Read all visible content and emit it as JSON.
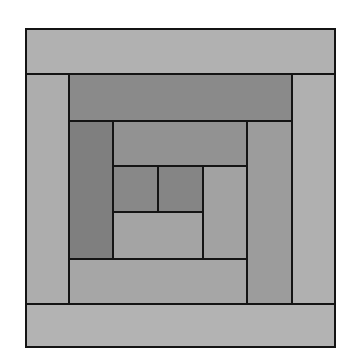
{
  "diagram": {
    "title": "",
    "outline_color": "#141414",
    "background": "#ffffff",
    "patches": [
      {
        "name": "outer-top-strip",
        "x": 25,
        "y": 28,
        "w": 311,
        "h": 47,
        "fill": "#b1b1b1"
      },
      {
        "name": "outer-bottom-strip",
        "x": 25,
        "y": 303,
        "w": 311,
        "h": 45,
        "fill": "#b3b3b3"
      },
      {
        "name": "outer-left-strip",
        "x": 25,
        "y": 73,
        "w": 45,
        "h": 232,
        "fill": "#adadad"
      },
      {
        "name": "outer-right-strip",
        "x": 291,
        "y": 73,
        "w": 45,
        "h": 232,
        "fill": "#b0b0b0"
      },
      {
        "name": "middle-top-strip",
        "x": 68,
        "y": 73,
        "w": 225,
        "h": 49,
        "fill": "#8a8a8a"
      },
      {
        "name": "middle-left-strip",
        "x": 68,
        "y": 120,
        "w": 46,
        "h": 140,
        "fill": "#7f7f7f"
      },
      {
        "name": "middle-bottom-strip",
        "x": 68,
        "y": 258,
        "w": 180,
        "h": 47,
        "fill": "#a6a6a6"
      },
      {
        "name": "middle-right-strip",
        "x": 246,
        "y": 120,
        "w": 47,
        "h": 185,
        "fill": "#9c9c9c"
      },
      {
        "name": "inner-top-strip",
        "x": 112,
        "y": 120,
        "w": 136,
        "h": 47,
        "fill": "#929292"
      },
      {
        "name": "center-left-square",
        "x": 112,
        "y": 165,
        "w": 47,
        "h": 48,
        "fill": "#888888"
      },
      {
        "name": "center-right-square",
        "x": 157,
        "y": 165,
        "w": 47,
        "h": 48,
        "fill": "#858585"
      },
      {
        "name": "inner-right-strip",
        "x": 202,
        "y": 165,
        "w": 46,
        "h": 95,
        "fill": "#a2a2a2"
      },
      {
        "name": "inner-bottom-strip",
        "x": 112,
        "y": 211,
        "w": 92,
        "h": 49,
        "fill": "#a4a4a4"
      }
    ]
  }
}
